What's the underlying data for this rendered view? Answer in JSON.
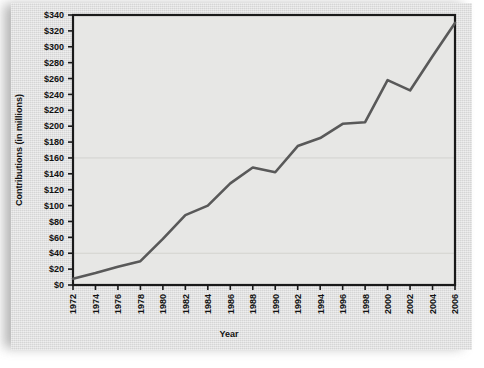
{
  "chart_data": {
    "type": "line",
    "title": "",
    "xlabel": "Year",
    "ylabel": "Contributions (in millions)",
    "x": [
      1972,
      1974,
      1976,
      1978,
      1980,
      1982,
      1984,
      1986,
      1988,
      1990,
      1992,
      1994,
      1996,
      1998,
      2000,
      2002,
      2004,
      2006
    ],
    "values": [
      8,
      15,
      23,
      30,
      58,
      88,
      100,
      128,
      148,
      142,
      175,
      185,
      203,
      205,
      258,
      245,
      288,
      330
    ],
    "series": [
      {
        "name": "Contributions",
        "values": [
          8,
          15,
          23,
          30,
          58,
          88,
          100,
          128,
          148,
          142,
          175,
          185,
          203,
          205,
          258,
          245,
          288,
          330
        ]
      }
    ],
    "xtick_labels": [
      "1972",
      "1974",
      "1976",
      "1978",
      "1980",
      "1982",
      "1984",
      "1986",
      "1988",
      "1990",
      "1992",
      "1994",
      "1996",
      "1998",
      "2000",
      "2002",
      "2004",
      "2006"
    ],
    "ytick_labels": [
      "$0",
      "$20",
      "$40",
      "$60",
      "$80",
      "$100",
      "$120",
      "$140",
      "$160",
      "$180",
      "$200",
      "$220",
      "$240",
      "$260",
      "$280",
      "$300",
      "$320",
      "$340"
    ],
    "ytick_values": [
      0,
      20,
      40,
      60,
      80,
      100,
      120,
      140,
      160,
      180,
      200,
      220,
      240,
      260,
      280,
      300,
      320,
      340
    ],
    "xlim": [
      1972,
      2006
    ],
    "ylim": [
      0,
      340
    ],
    "grid": false,
    "legend": null,
    "line_color": "#595959",
    "plot_background": "#e7e7e5",
    "card_background": "#dcdcdc",
    "axis_color": "#1a1a1a"
  }
}
